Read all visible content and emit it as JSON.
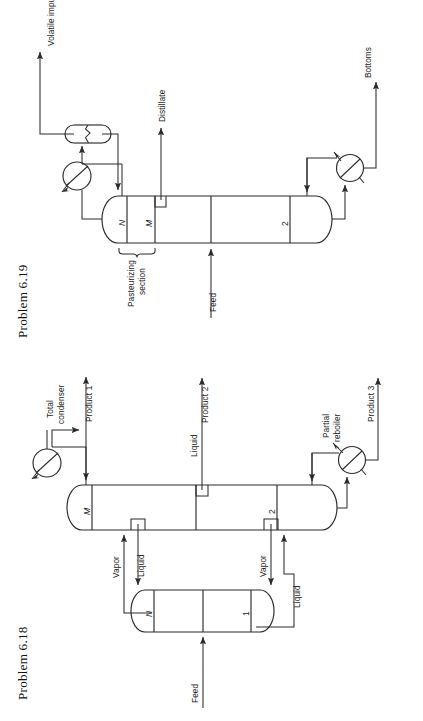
{
  "page": {
    "background": "#ffffff",
    "ink": "#2b2b2b",
    "width": 423,
    "height": 721
  },
  "figures": [
    {
      "id": "problem-6-19",
      "caption": "Problem 6.19",
      "description": "Distillation column with pasteurizing section, reflux drum, condenser and reboiler",
      "orientation": "rotated-90-ccw",
      "stage_labels": [
        "N",
        "M",
        "2"
      ],
      "stream_labels": [
        "Volatile impurities",
        "Distillate",
        "Bottoms",
        "Feed"
      ],
      "annotations": [
        "Pasteurizing",
        "section"
      ],
      "equipment": [
        "reflux-drum",
        "condenser",
        "reboiler"
      ]
    },
    {
      "id": "problem-6-18",
      "caption": "Problem 6.18",
      "description": "Thermally coupled (Petlyuk) column arrangement: prefractionator plus main column",
      "orientation": "rotated-90-ccw",
      "stage_labels": [
        "M",
        "2",
        "N",
        "1"
      ],
      "stream_labels": [
        "Product 1",
        "Product 2",
        "Product 3",
        "Feed",
        "Vapor",
        "Liquid",
        "Vapor",
        "Liquid",
        "Liquid"
      ],
      "annotations": [
        "Total",
        "condenser",
        "Partial",
        "reboiler"
      ],
      "equipment": [
        "total-condenser",
        "partial-reboiler"
      ]
    }
  ],
  "f619": {
    "caption": "Problem 6.19",
    "volatile_impurities": "Volatile impurities",
    "distillate": "Distillate",
    "bottoms": "Bottoms",
    "feed": "Feed",
    "pasteurizing": "Pasteurizing",
    "section": "section",
    "stage_N": "N",
    "stage_M": "M",
    "stage_2": "2"
  },
  "f618": {
    "caption": "Problem 6.18",
    "total": "Total",
    "condenser": "condenser",
    "partial": "Partial",
    "reboiler": "reboiler",
    "product1": "Product 1",
    "product2": "Product 2",
    "product3": "Product 3",
    "feed": "Feed",
    "vapor_left": "Vapor",
    "liquid_left": "Liquid",
    "vapor_right": "Vapor",
    "liquid_right": "Liquid",
    "liquid_mid": "Liquid",
    "stage_M": "M",
    "stage_2": "2",
    "stage_N": "N",
    "stage_1": "1"
  }
}
